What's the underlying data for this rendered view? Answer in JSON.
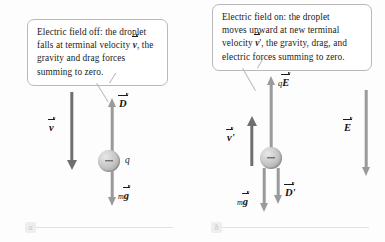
{
  "figure": {
    "background_color": "#fdfdfd",
    "vector_color": "#8c8c8c",
    "dark_vector_color": "#6f6f6f",
    "callout_border_color": "#b9b9b9"
  },
  "panel_a": {
    "badge": "a",
    "callout": {
      "lines": [
        "Electric field off: the droplet",
        "falls at terminal velocity ",
        ", the",
        "gravity and drag forces",
        "summing to zero."
      ],
      "vector_symbol": "v"
    },
    "vectors": [
      {
        "name": "velocity",
        "label": "v",
        "prime": "",
        "prefix": "",
        "direction": "down"
      },
      {
        "name": "drag",
        "label": "D",
        "prime": "",
        "prefix": "",
        "direction": "up"
      },
      {
        "name": "gravity",
        "label": "g",
        "prime": "",
        "prefix": "m",
        "direction": "down"
      }
    ],
    "droplet": {
      "charge_label": "q",
      "sign": "minus"
    }
  },
  "panel_b": {
    "badge": "b",
    "callout": {
      "lines": [
        "Electric field on: the droplet",
        "moves upward at new terminal",
        "velocity ",
        ", the gravity, drag, and",
        "electric forces summing to zero."
      ],
      "vector_symbol": "v",
      "vector_prime": "'"
    },
    "vectors": [
      {
        "name": "velocity-prime",
        "label": "v",
        "prime": "'",
        "prefix": "",
        "direction": "up"
      },
      {
        "name": "electric-force",
        "label": "E",
        "prime": "",
        "prefix": "q",
        "direction": "up"
      },
      {
        "name": "drag-prime",
        "label": "D",
        "prime": "'",
        "prefix": "",
        "direction": "down"
      },
      {
        "name": "gravity",
        "label": "g",
        "prime": "",
        "prefix": "m",
        "direction": "down"
      },
      {
        "name": "electric-field",
        "label": "E",
        "prime": "",
        "prefix": "",
        "direction": "down"
      }
    ],
    "droplet": {
      "charge_label": "",
      "sign": "minus"
    }
  }
}
